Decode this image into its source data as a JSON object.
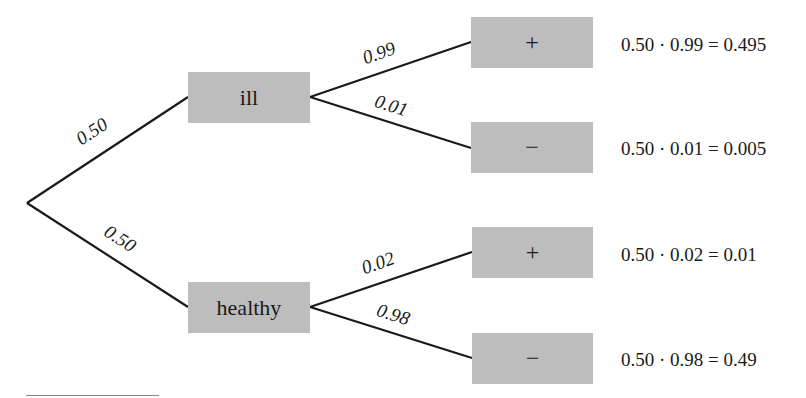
{
  "diagram": {
    "type": "probability-tree",
    "root": {
      "x": 27,
      "y": 203
    },
    "first_level": [
      {
        "id": "ill",
        "label": "ill",
        "probability": "0.50",
        "children": [
          {
            "label": "+",
            "probability": "0.99",
            "result": "0.50 · 0.99 = 0.495"
          },
          {
            "label": "−",
            "probability": "0.01",
            "result": "0.50 · 0.01 = 0.005"
          }
        ]
      },
      {
        "id": "healthy",
        "label": "healthy",
        "probability": "0.50",
        "children": [
          {
            "label": "+",
            "probability": "0.02",
            "result": "0.50 · 0.02 = 0.01"
          },
          {
            "label": "−",
            "probability": "0.98",
            "result": "0.50 · 0.98 = 0.49"
          }
        ]
      }
    ],
    "colors": {
      "box_fill": "#bdbdbd",
      "line": "#1a1a1a",
      "text": "#1a1a1a"
    }
  }
}
